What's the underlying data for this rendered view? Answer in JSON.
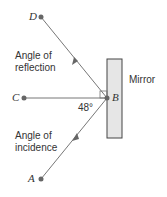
{
  "diagram": {
    "points": {
      "A": "A",
      "B": "B",
      "C": "C",
      "D": "D"
    },
    "labels": {
      "reflection_line1": "Angle of",
      "reflection_line2": "reflection",
      "incidence_line1": "Angle of",
      "incidence_line2": "incidence",
      "mirror": "Mirror",
      "angle": "48°"
    },
    "colors": {
      "line": "#777777",
      "mirror_fill": "#e6e6e6",
      "mirror_stroke": "#444444"
    }
  }
}
